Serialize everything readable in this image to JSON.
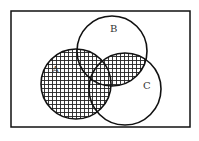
{
  "diagram": {
    "type": "venn",
    "universe": {
      "x": 11,
      "y": 11,
      "width": 179,
      "height": 116
    },
    "sets": [
      {
        "name": "A",
        "label": "A",
        "cx": 76,
        "cy": 84,
        "r": 35,
        "label_x": 52,
        "label_y": 73
      },
      {
        "name": "B",
        "label": "B",
        "cx": 112,
        "cy": 51,
        "r": 35,
        "label_x": 110,
        "label_y": 32
      },
      {
        "name": "C",
        "label": "C",
        "cx": 125,
        "cy": 89,
        "r": 36,
        "label_x": 143,
        "label_y": 89
      }
    ],
    "shaded_region": "A ∪ (B ∩ C)",
    "shading_pattern": "crosshatch-grid",
    "colors": {
      "stroke": "#111111",
      "hatch": "#222222",
      "background": "#ffffff"
    }
  }
}
